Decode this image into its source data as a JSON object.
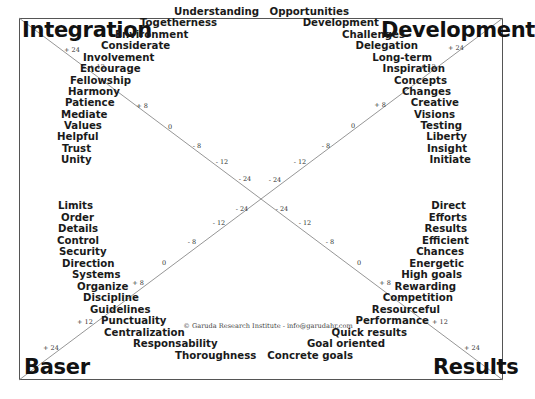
{
  "corners": {
    "top_left": "Integration",
    "top_right": "Development",
    "bottom_left": "Baser",
    "bottom_right": "Results"
  },
  "quadrants": {
    "integration": [
      "Understanding",
      "Togetherness",
      "Environment",
      "Considerate",
      "Involvement",
      "Encourage",
      "Fellowship",
      "Harmony",
      "Patience",
      "Mediate",
      "Values",
      "Helpful",
      "Trust",
      "Unity"
    ],
    "development": [
      "Opportunities",
      "Development",
      "Challenges",
      "Delegation",
      "Long-term",
      "Inspiration",
      "Concepts",
      "Changes",
      "Creative",
      "Visions",
      "Testing",
      "Liberty",
      "Insight",
      "Initiate"
    ],
    "baser": [
      "Limits",
      "Order",
      "Details",
      "Control",
      "Security",
      "Direction",
      "Systems",
      "Organize",
      "Discipline",
      "Guidelines",
      "Punctuality",
      "Centralization",
      "Responsability",
      "Thoroughness"
    ],
    "results": [
      "Direct",
      "Efforts",
      "Results",
      "Efficient",
      "Chances",
      "Energetic",
      "High goals",
      "Rewarding",
      "Competition",
      "Resourceful",
      "Performance",
      "Quick results",
      "Goal oriented",
      "Concrete goals"
    ]
  },
  "scale_ticks": [
    "+ 24",
    "+ 12",
    "+ 8",
    "0",
    "- 8",
    "- 12",
    "- 24"
  ],
  "copyright": "© Garuda Research Institute - info@garudahr.com",
  "colors": {
    "line": "#888888",
    "frame": "#555555",
    "text": "#1a1a1a"
  }
}
